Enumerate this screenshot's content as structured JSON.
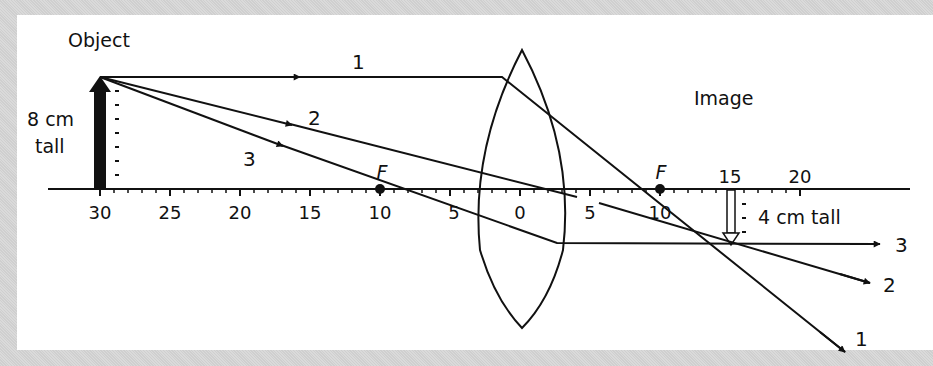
{
  "diagram": {
    "title_object": "Object",
    "title_image": "Image",
    "object_height_label_line1": "8 cm",
    "object_height_label_line2": "tall",
    "image_height_label": "4 cm tall",
    "focal_label": "F",
    "axis_ticks": [
      {
        "label": "30",
        "x": 100
      },
      {
        "label": "25",
        "x": 170
      },
      {
        "label": "20",
        "x": 240
      },
      {
        "label": "15",
        "x": 310
      },
      {
        "label": "10",
        "x": 380
      },
      {
        "label": "5",
        "x": 450
      },
      {
        "label": "0",
        "x": 520
      },
      {
        "label": "5",
        "x": 590
      },
      {
        "label": "10",
        "x": 660
      },
      {
        "label": "15",
        "x": 730
      },
      {
        "label": "20",
        "x": 800
      }
    ],
    "rays": [
      {
        "id": "1",
        "label": "1",
        "description": "Parallel to axis, refracts through far focal point"
      },
      {
        "id": "2",
        "label": "2",
        "description": "Through center of lens, undeviated"
      },
      {
        "id": "3",
        "label": "3",
        "description": "Through near focal point, exits parallel to axis"
      }
    ],
    "object": {
      "distance_cm": 30,
      "height_cm": 8
    },
    "image": {
      "distance_cm": 15,
      "height_cm": 4,
      "orientation": "inverted"
    },
    "focal_length_cm": 10,
    "colors": {
      "ink": "#111111",
      "panel": "#ffffff",
      "border": "#d4d4d4"
    }
  }
}
